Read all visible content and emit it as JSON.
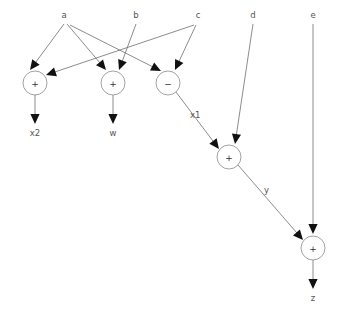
{
  "diagram": {
    "background_color": "#ffffff",
    "edge_color": "#6e6e6e",
    "node_stroke_color": "#8a8a8a",
    "node_fill_color": "#ffffff",
    "arrow_color": "#111111",
    "label_color": "#555555"
  },
  "inputs": [
    {
      "id": "a",
      "label": "a",
      "x": 64,
      "y": 18
    },
    {
      "id": "b",
      "label": "b",
      "x": 136,
      "y": 18
    },
    {
      "id": "c",
      "label": "c",
      "x": 198,
      "y": 18
    },
    {
      "id": "d",
      "label": "d",
      "x": 253,
      "y": 18
    },
    {
      "id": "e",
      "label": "e",
      "x": 313,
      "y": 18
    }
  ],
  "nodes": [
    {
      "id": "n1",
      "op": "+",
      "cx": 35,
      "cy": 83,
      "r": 12
    },
    {
      "id": "n2",
      "op": "+",
      "cx": 113,
      "cy": 83,
      "r": 12
    },
    {
      "id": "n3",
      "op": "−",
      "cx": 168,
      "cy": 83,
      "r": 12
    },
    {
      "id": "n4",
      "op": "+",
      "cx": 229,
      "cy": 157,
      "r": 12
    },
    {
      "id": "n5",
      "op": "+",
      "cx": 313,
      "cy": 248,
      "r": 12
    }
  ],
  "outputs": [
    {
      "id": "x2",
      "label": "x2",
      "x": 35,
      "y": 136
    },
    {
      "id": "w",
      "label": "w",
      "x": 113,
      "y": 136
    },
    {
      "id": "z",
      "label": "z",
      "x": 313,
      "y": 301
    }
  ],
  "edge_labels": [
    {
      "id": "x1",
      "label": "x1",
      "x": 190,
      "y": 118
    },
    {
      "id": "y",
      "label": "y",
      "x": 264,
      "y": 193
    }
  ],
  "edges": [
    {
      "id": "a-n1",
      "from": "a",
      "to": "n1",
      "x1": 64,
      "y1": 24,
      "x2": 30,
      "y2": 70
    },
    {
      "id": "a-n2",
      "from": "a",
      "to": "n2",
      "x1": 67,
      "y1": 24,
      "x2": 106,
      "y2": 70
    },
    {
      "id": "a-n3",
      "from": "a",
      "to": "n3",
      "x1": 70,
      "y1": 25,
      "x2": 161,
      "y2": 71
    },
    {
      "id": "b-n2",
      "from": "b",
      "to": "n2",
      "x1": 136,
      "y1": 24,
      "x2": 119,
      "y2": 70
    },
    {
      "id": "c-n1",
      "from": "c",
      "to": "n1",
      "x1": 194,
      "y1": 25,
      "x2": 46,
      "y2": 75
    },
    {
      "id": "c-n3",
      "from": "c",
      "to": "n3",
      "x1": 196,
      "y1": 25,
      "x2": 175,
      "y2": 70
    },
    {
      "id": "n3-n4",
      "from": "n3",
      "to": "n4",
      "x1": 176,
      "y1": 92,
      "x2": 219,
      "y2": 149
    },
    {
      "id": "d-n4",
      "from": "d",
      "to": "n4",
      "x1": 253,
      "y1": 24,
      "x2": 235,
      "y2": 144
    },
    {
      "id": "n4-n5",
      "from": "n4",
      "to": "n5",
      "x1": 238,
      "y1": 165,
      "x2": 303,
      "y2": 240
    },
    {
      "id": "e-n5",
      "from": "e",
      "to": "n5",
      "x1": 313,
      "y1": 24,
      "x2": 313,
      "y2": 234
    },
    {
      "id": "n1-x2",
      "from": "n1",
      "to": "x2",
      "x1": 35,
      "y1": 95,
      "x2": 35,
      "y2": 124
    },
    {
      "id": "n2-w",
      "from": "n2",
      "to": "w",
      "x1": 113,
      "y1": 95,
      "x2": 113,
      "y2": 124
    },
    {
      "id": "n5-z",
      "from": "n5",
      "to": "z",
      "x1": 313,
      "y1": 260,
      "x2": 313,
      "y2": 289
    }
  ]
}
